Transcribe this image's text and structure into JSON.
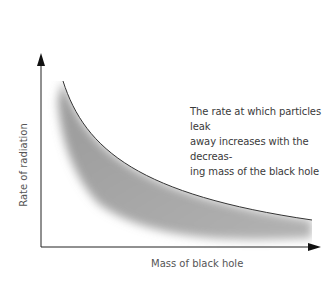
{
  "diagram": {
    "title": "",
    "y_axis_label": "Rate of radiation",
    "x_axis_label": "Mass of black hole",
    "annotation": "The rate at which particles leak away increases with the decreasing mass of the black hole",
    "annotation_lines": [
      "The rate at which particles leak",
      "away increases with the decreas-",
      "ing mass of the black hole"
    ],
    "curve": "decreasing hyperbolic curve with grey shaded band beneath",
    "colors": {
      "axis": "#222222",
      "curve": "#333333",
      "shade": "#888888",
      "text": "#3a3a3a"
    }
  }
}
